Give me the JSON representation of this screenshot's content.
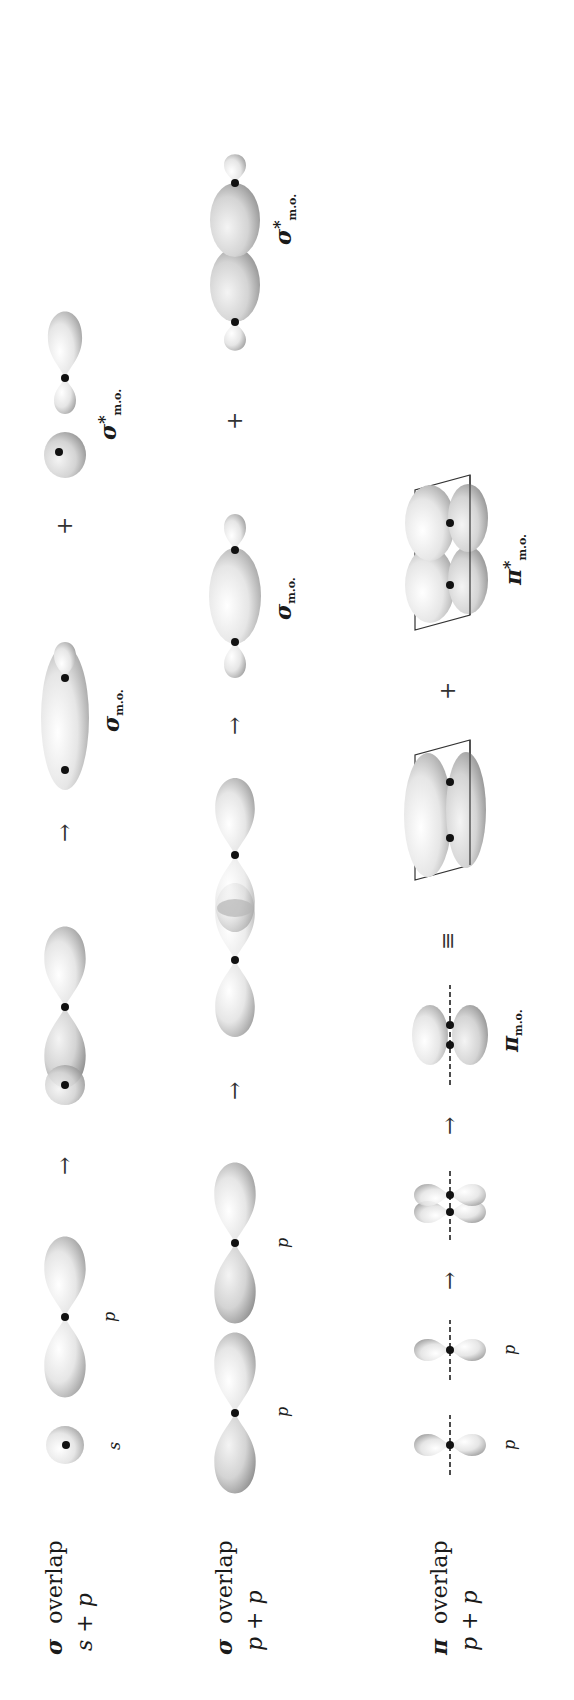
{
  "page": {
    "orientation": "rotated-90-ccw",
    "page_number_visible": "partially cropped at top edge"
  },
  "rows": [
    {
      "id": "sigma-sp",
      "title_symbol": "σ",
      "title_word": "overlap",
      "subtitle": "s + p",
      "steps": [
        {
          "type": "orbital",
          "shape": "s-sphere",
          "label": "s"
        },
        {
          "type": "orbital",
          "shape": "p-dumbbell-horizontal",
          "label": "p"
        },
        {
          "type": "operator",
          "symbol": "→"
        },
        {
          "type": "orbital",
          "shape": "s-p-overlap",
          "label": ""
        },
        {
          "type": "operator",
          "symbol": "→"
        },
        {
          "type": "orbital",
          "shape": "sigma-bonding",
          "label": "σ",
          "sub": "m.o."
        },
        {
          "type": "operator",
          "symbol": "+"
        },
        {
          "type": "orbital",
          "shape": "sigma-antibonding-sp",
          "label": "σ",
          "sup": "*",
          "sub": "m.o."
        }
      ]
    },
    {
      "id": "sigma-pp",
      "title_symbol": "σ",
      "title_word": "overlap",
      "subtitle": "p + p",
      "steps": [
        {
          "type": "orbital",
          "shape": "p-dumbbell-horizontal",
          "label": "p"
        },
        {
          "type": "orbital",
          "shape": "p-dumbbell-horizontal",
          "label": "p"
        },
        {
          "type": "operator",
          "symbol": "→"
        },
        {
          "type": "orbital",
          "shape": "p-p-end-overlap",
          "label": ""
        },
        {
          "type": "operator",
          "symbol": "→"
        },
        {
          "type": "orbital",
          "shape": "sigma-bonding-pp",
          "label": "σ",
          "sub": "m.o."
        },
        {
          "type": "operator",
          "symbol": "+"
        },
        {
          "type": "orbital",
          "shape": "sigma-antibonding-pp",
          "label": "σ",
          "sup": "*",
          "sub": "m.o."
        }
      ]
    },
    {
      "id": "pi-pp",
      "title_symbol": "π",
      "title_word": "overlap",
      "subtitle": "p + p",
      "steps": [
        {
          "type": "orbital",
          "shape": "p-vertical-with-axis",
          "label": "p"
        },
        {
          "type": "orbital",
          "shape": "p-vertical-with-axis",
          "label": "p"
        },
        {
          "type": "operator",
          "symbol": "→"
        },
        {
          "type": "orbital",
          "shape": "p-side-by-side",
          "label": ""
        },
        {
          "type": "operator",
          "symbol": "→"
        },
        {
          "type": "orbital",
          "shape": "pi-bonding",
          "label": "π",
          "sub": "m.o."
        },
        {
          "type": "operator",
          "symbol": "≡"
        },
        {
          "type": "orbital",
          "shape": "pi-bonding-3d-with-plane",
          "label": ""
        },
        {
          "type": "operator",
          "symbol": "+"
        },
        {
          "type": "orbital",
          "shape": "pi-antibonding-3d-with-plane",
          "label": "π",
          "sup": "*",
          "sub": "m.o."
        }
      ]
    }
  ],
  "colors": {
    "lobe_fill": "#e9e9e9",
    "lobe_shade": "#9a9a9a",
    "nucleus": "#111111",
    "text": "#1a1a1a"
  }
}
